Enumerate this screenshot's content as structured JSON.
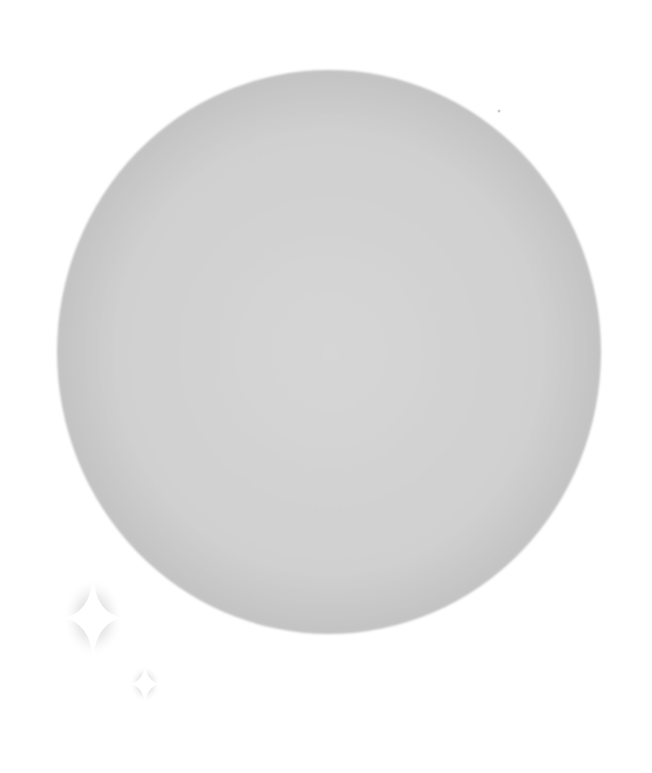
{
  "scene": {
    "caption": "Gray circle with sparkles",
    "background_color": "#ffffff",
    "circle": {
      "cx": 329,
      "cy": 352,
      "rx": 272,
      "ry": 282,
      "center_color": "#d6d6d6",
      "mid_color": "#d0d0d0",
      "edge_color": "#c3c3c3"
    },
    "sparkles": [
      {
        "name": "large-sparkle",
        "cx": 93,
        "cy": 618,
        "arm_v": 42,
        "arm_h": 32,
        "fill": "#ffffff",
        "glow": "#9a9a9a"
      },
      {
        "name": "small-sparkle",
        "cx": 145,
        "cy": 684,
        "arm_v": 19,
        "arm_h": 16,
        "fill": "#ffffff",
        "glow": "#9a9a9a"
      }
    ],
    "speck": {
      "cx": 499,
      "cy": 111,
      "r": 1.5,
      "color": "#c8c8c8"
    }
  }
}
